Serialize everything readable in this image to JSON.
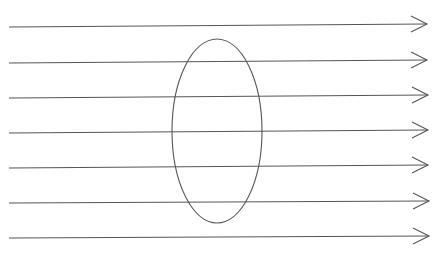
{
  "diagram": {
    "stroke_color": "#555555",
    "field_lines": [
      {
        "x1": 9,
        "y1": 27,
        "x2": 427,
        "y2": 24
      },
      {
        "x1": 9,
        "y1": 63,
        "x2": 427,
        "y2": 60
      },
      {
        "x1": 9,
        "y1": 98,
        "x2": 428,
        "y2": 95
      },
      {
        "x1": 9,
        "y1": 133,
        "x2": 428,
        "y2": 130
      },
      {
        "x1": 9,
        "y1": 168,
        "x2": 428,
        "y2": 165
      },
      {
        "x1": 9,
        "y1": 203,
        "x2": 429,
        "y2": 201
      },
      {
        "x1": 9,
        "y1": 238,
        "x2": 429,
        "y2": 236
      }
    ],
    "loop": {
      "cx": 217,
      "cy": 131,
      "rx": 45,
      "ry": 92
    }
  }
}
